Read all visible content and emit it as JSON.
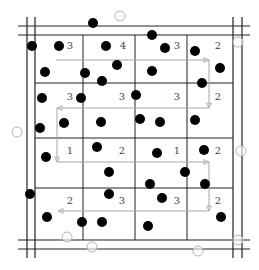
{
  "diagram": {
    "title": "",
    "colors": {
      "grid": "#222222",
      "arrow": "#a6a6a6",
      "dot": "#000000",
      "open_circle": "#b3b3b3",
      "label": "#444444"
    },
    "frame": {
      "vertical_lines_x": [
        27,
        35,
        233,
        242
      ],
      "horizontal_lines_y": [
        26,
        35,
        240,
        249
      ],
      "extent": {
        "x1": 18,
        "x2": 250,
        "y1": 17,
        "y2": 258
      }
    },
    "grid": {
      "columns_x": [
        35,
        83,
        135,
        187,
        233
      ],
      "rows_y": [
        35,
        83,
        138,
        188,
        240
      ]
    },
    "cell_labels": [
      {
        "row": 0,
        "col": 0,
        "text": "3",
        "x": 70,
        "y": 49
      },
      {
        "row": 0,
        "col": 1,
        "text": "4",
        "x": 123,
        "y": 49
      },
      {
        "row": 0,
        "col": 2,
        "text": "3",
        "x": 177,
        "y": 49
      },
      {
        "row": 0,
        "col": 3,
        "text": "2",
        "x": 218,
        "y": 49
      },
      {
        "row": 1,
        "col": 0,
        "text": "3",
        "x": 70,
        "y": 100
      },
      {
        "row": 1,
        "col": 1,
        "text": "3",
        "x": 122,
        "y": 100
      },
      {
        "row": 1,
        "col": 2,
        "text": "3",
        "x": 177,
        "y": 100
      },
      {
        "row": 1,
        "col": 3,
        "text": "2",
        "x": 218,
        "y": 100
      },
      {
        "row": 2,
        "col": 0,
        "text": "1",
        "x": 70,
        "y": 154
      },
      {
        "row": 2,
        "col": 1,
        "text": "2",
        "x": 122,
        "y": 154
      },
      {
        "row": 2,
        "col": 2,
        "text": "1",
        "x": 177,
        "y": 154
      },
      {
        "row": 2,
        "col": 3,
        "text": "2",
        "x": 218,
        "y": 154
      },
      {
        "row": 3,
        "col": 0,
        "text": "2",
        "x": 70,
        "y": 204
      },
      {
        "row": 3,
        "col": 1,
        "text": "3",
        "x": 122,
        "y": 204
      },
      {
        "row": 3,
        "col": 2,
        "text": "3",
        "x": 177,
        "y": 204
      },
      {
        "row": 3,
        "col": 3,
        "text": "2",
        "x": 218,
        "y": 204
      }
    ],
    "scan_path": {
      "points": [
        [
          56,
          60
        ],
        [
          209,
          60
        ],
        [
          209,
          108
        ],
        [
          57,
          108
        ],
        [
          57,
          162
        ],
        [
          209,
          162
        ],
        [
          209,
          211
        ],
        [
          58,
          211
        ]
      ],
      "arrowheads": [
        [
          209,
          60,
          "right"
        ],
        [
          209,
          108,
          "down"
        ],
        [
          57,
          108,
          "left"
        ],
        [
          57,
          162,
          "down"
        ],
        [
          209,
          162,
          "right"
        ],
        [
          209,
          211,
          "down"
        ],
        [
          58,
          211,
          "left"
        ]
      ]
    },
    "filled_points": [
      [
        32,
        46
      ],
      [
        59,
        46
      ],
      [
        93,
        23
      ],
      [
        106,
        46
      ],
      [
        152,
        35
      ],
      [
        165,
        48
      ],
      [
        195,
        51
      ],
      [
        45,
        72
      ],
      [
        85,
        73
      ],
      [
        117,
        65
      ],
      [
        102,
        81
      ],
      [
        152,
        71
      ],
      [
        220,
        68
      ],
      [
        202,
        83
      ],
      [
        42,
        98
      ],
      [
        81,
        98
      ],
      [
        136,
        95
      ],
      [
        40,
        128
      ],
      [
        64,
        123
      ],
      [
        101,
        122
      ],
      [
        140,
        119
      ],
      [
        160,
        122
      ],
      [
        195,
        120
      ],
      [
        46,
        157
      ],
      [
        97,
        147
      ],
      [
        157,
        153
      ],
      [
        204,
        150
      ],
      [
        109,
        172
      ],
      [
        185,
        172
      ],
      [
        150,
        184
      ],
      [
        205,
        184
      ],
      [
        30,
        194
      ],
      [
        109,
        194
      ],
      [
        162,
        198
      ],
      [
        47,
        217
      ],
      [
        82,
        222
      ],
      [
        102,
        222
      ],
      [
        148,
        226
      ],
      [
        221,
        217
      ]
    ],
    "open_points": [
      [
        120,
        16
      ],
      [
        238,
        42
      ],
      [
        17,
        132
      ],
      [
        241,
        151
      ],
      [
        67,
        237
      ],
      [
        92,
        247
      ],
      [
        198,
        251
      ],
      [
        238,
        240
      ]
    ]
  }
}
